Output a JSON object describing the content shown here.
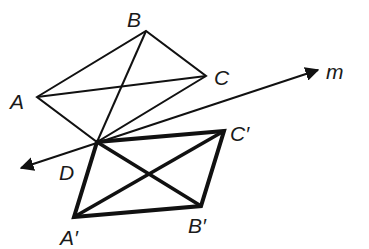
{
  "diagram": {
    "line": {
      "label": "m",
      "start": [
        21,
        168
      ],
      "end": [
        318,
        70
      ],
      "label_pos": [
        326,
        79
      ]
    },
    "original": {
      "vertices": {
        "A": [
          37,
          97
        ],
        "B": [
          146,
          31
        ],
        "C": [
          206,
          76
        ],
        "D": [
          97,
          142
        ]
      },
      "labels": {
        "A": {
          "text": "A",
          "pos": [
            10,
            109
          ]
        },
        "B": {
          "text": "B",
          "pos": [
            127,
            27
          ]
        },
        "C": {
          "text": "C",
          "pos": [
            214,
            85
          ]
        },
        "D": {
          "text": "D",
          "pos": [
            59,
            180
          ]
        }
      },
      "stroke_width": 2
    },
    "image": {
      "vertices": {
        "A'": [
          74,
          217
        ],
        "B'": [
          201,
          206
        ],
        "C'": [
          224,
          131
        ],
        "D": [
          97,
          142
        ]
      },
      "labels": {
        "A'": {
          "text": "A′",
          "pos": [
            60,
            245
          ]
        },
        "B'": {
          "text": "B′",
          "pos": [
            188,
            233
          ]
        },
        "C'": {
          "text": "C′",
          "pos": [
            230,
            141
          ]
        }
      },
      "stroke_width": 4
    },
    "colors": {
      "stroke": "#111111",
      "background": "#ffffff"
    }
  }
}
